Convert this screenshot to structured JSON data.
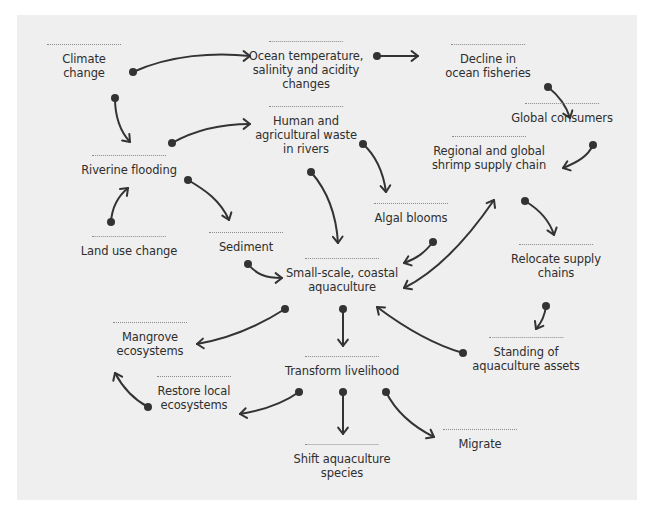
{
  "diagram": {
    "title": "",
    "colors": {
      "background": "#efefef",
      "page": "#ffffff",
      "text": "#2e2e2e",
      "arrow": "#333333",
      "rule": "#8a8a8a"
    },
    "nodes": [
      {
        "id": "climate",
        "label_lines": [
          "Climate",
          "change"
        ],
        "x": 84,
        "y": 44,
        "rule_w": 74
      },
      {
        "id": "ocean",
        "label_lines": [
          "Ocean temperature,",
          "salinity and acidity",
          "changes"
        ],
        "x": 306,
        "y": 41,
        "rule_w": 74
      },
      {
        "id": "fisheries",
        "label_lines": [
          "Decline in",
          "ocean fisheries"
        ],
        "x": 488,
        "y": 44,
        "rule_w": 74
      },
      {
        "id": "global_consumers",
        "label_lines": [
          "Global consumers"
        ],
        "x": 562,
        "y": 103,
        "rule_w": 74
      },
      {
        "id": "human_waste",
        "label_lines": [
          "Human and",
          "agricultural waste",
          "in rivers"
        ],
        "x": 306,
        "y": 106,
        "rule_w": 74
      },
      {
        "id": "supply_chain",
        "label_lines": [
          "Regional and global",
          "shrimp supply chain"
        ],
        "x": 489,
        "y": 136,
        "rule_w": 74
      },
      {
        "id": "riverine",
        "label_lines": [
          "Riverine flooding"
        ],
        "x": 129,
        "y": 155,
        "rule_w": 74
      },
      {
        "id": "algal",
        "label_lines": [
          "Algal blooms"
        ],
        "x": 411,
        "y": 203,
        "rule_w": 74
      },
      {
        "id": "land_use",
        "label_lines": [
          "Land use change"
        ],
        "x": 129,
        "y": 236,
        "rule_w": 74
      },
      {
        "id": "sediment",
        "label_lines": [
          "Sediment"
        ],
        "x": 246,
        "y": 232,
        "rule_w": 74
      },
      {
        "id": "relocate",
        "label_lines": [
          "Relocate supply",
          "chains"
        ],
        "x": 556,
        "y": 244,
        "rule_w": 74
      },
      {
        "id": "aquaculture",
        "label_lines": [
          "Small-scale, coastal",
          "aquaculture"
        ],
        "x": 342,
        "y": 258,
        "rule_w": 74
      },
      {
        "id": "mangrove",
        "label_lines": [
          "Mangrove",
          "ecosystems"
        ],
        "x": 150,
        "y": 322,
        "rule_w": 74
      },
      {
        "id": "standing",
        "label_lines": [
          "Standing of",
          "aquaculture assets"
        ],
        "x": 526,
        "y": 337,
        "rule_w": 74
      },
      {
        "id": "transform",
        "label_lines": [
          "Transform livelihood"
        ],
        "x": 342,
        "y": 356,
        "rule_w": 74
      },
      {
        "id": "restore",
        "label_lines": [
          "Restore local",
          "ecosystems"
        ],
        "x": 194,
        "y": 376,
        "rule_w": 74
      },
      {
        "id": "migrate",
        "label_lines": [
          "Migrate"
        ],
        "x": 480,
        "y": 429,
        "rule_w": 74
      },
      {
        "id": "shift",
        "label_lines": [
          "Shift aquaculture",
          "species"
        ],
        "x": 342,
        "y": 444,
        "rule_w": 74
      }
    ],
    "edges": [
      {
        "from": "climate",
        "to": "ocean",
        "path": "M133,72 C170,55 215,52 250,56",
        "start_dot": [
          133,
          72
        ],
        "end_head": [
          250,
          56
        ],
        "head_angle": 0
      },
      {
        "from": "climate",
        "to": "riverine",
        "path": "M115,98 C115,115 119,130 130,142",
        "start_dot": [
          115,
          98
        ],
        "end_head": [
          130,
          142
        ],
        "head_angle": 48
      },
      {
        "from": "ocean",
        "to": "fisheries",
        "path": "M377,56 L418,56",
        "start_dot": [
          377,
          56
        ],
        "end_head": [
          418,
          56
        ],
        "head_angle": 0
      },
      {
        "from": "fisheries",
        "to": "global_consumers",
        "path": "M548,87 C558,95 566,105 570,118",
        "start_dot": [
          548,
          87
        ],
        "end_head": [
          570,
          118
        ],
        "head_angle": 70
      },
      {
        "from": "riverine",
        "to": "human_waste",
        "path": "M172,143 C195,130 220,124 250,124",
        "start_dot": [
          172,
          143
        ],
        "end_head": [
          250,
          124
        ],
        "head_angle": 0
      },
      {
        "from": "human_waste",
        "to": "algal",
        "path": "M363,144 C375,155 383,170 386,192",
        "start_dot": [
          363,
          144
        ],
        "end_head": [
          386,
          192
        ],
        "head_angle": 85
      },
      {
        "from": "global_consumers",
        "to": "supply_chain",
        "path": "M593,145 C588,156 578,162 563,168",
        "start_dot": [
          593,
          145
        ],
        "end_head": [
          563,
          168
        ],
        "head_angle": 160
      },
      {
        "from": "human_waste",
        "to": "aquaculture",
        "path": "M311,172 C325,188 336,210 338,243",
        "start_dot": [
          311,
          172
        ],
        "end_head": [
          338,
          243
        ],
        "head_angle": 88
      },
      {
        "from": "supply_chain",
        "to": "aquaculture",
        "path": "M494,200 C470,235 440,270 404,288",
        "start_dot": null,
        "end_head": [
          404,
          288
        ],
        "head_angle": 152,
        "start_head": [
          494,
          200
        ],
        "start_head_angle": -60
      },
      {
        "from": "supply_chain",
        "to": "relocate",
        "path": "M525,201 C540,210 550,222 554,235",
        "start_dot": [
          525,
          201
        ],
        "end_head": [
          554,
          235
        ],
        "head_angle": 72
      },
      {
        "from": "algal",
        "to": "aquaculture",
        "path": "M433,242 C425,252 418,258 404,263",
        "start_dot": [
          433,
          242
        ],
        "end_head": [
          404,
          263
        ],
        "head_angle": 160
      },
      {
        "from": "land_use",
        "to": "riverine",
        "path": "M111,222 C112,207 117,197 128,188",
        "start_dot": [
          111,
          222
        ],
        "end_head": [
          128,
          188
        ],
        "head_angle": -45
      },
      {
        "from": "riverine",
        "to": "sediment",
        "path": "M188,180 C205,190 220,200 229,220",
        "start_dot": [
          188,
          180
        ],
        "end_head": [
          229,
          220
        ],
        "head_angle": 70
      },
      {
        "from": "sediment",
        "to": "aquaculture",
        "path": "M248,264 C256,274 265,278 282,278",
        "start_dot": [
          248,
          264
        ],
        "end_head": [
          282,
          278
        ],
        "head_angle": 0
      },
      {
        "from": "relocate",
        "to": "standing",
        "path": "M546,306 C545,315 542,322 536,329",
        "start_dot": [
          546,
          306
        ],
        "end_head": [
          536,
          329
        ],
        "head_angle": 120
      },
      {
        "from": "aquaculture",
        "to": "mangrove",
        "path": "M285,309 C260,325 232,338 197,344",
        "start_dot": [
          285,
          309
        ],
        "end_head": [
          197,
          344
        ],
        "head_angle": 175
      },
      {
        "from": "aquaculture",
        "to": "transform",
        "path": "M343,309 L343,346",
        "start_dot": [
          343,
          309
        ],
        "end_head": [
          343,
          346
        ],
        "head_angle": 90
      },
      {
        "from": "standing",
        "to": "aquaculture",
        "path": "M463,353 C435,345 405,328 377,307",
        "start_dot": [
          463,
          353
        ],
        "end_head": [
          377,
          307
        ],
        "head_angle": -140
      },
      {
        "from": "restore",
        "to": "mangrove",
        "path": "M148,407 C135,400 124,390 115,373",
        "start_dot": [
          148,
          407
        ],
        "end_head": [
          115,
          373
        ],
        "head_angle": -115
      },
      {
        "from": "transform",
        "to": "restore",
        "path": "M299,392 C285,402 265,410 240,414",
        "start_dot": [
          299,
          392
        ],
        "end_head": [
          240,
          414
        ],
        "head_angle": 172
      },
      {
        "from": "transform",
        "to": "shift",
        "path": "M343,392 L343,434",
        "start_dot": [
          343,
          392
        ],
        "end_head": [
          343,
          434
        ],
        "head_angle": 90
      },
      {
        "from": "transform",
        "to": "migrate",
        "path": "M386,392 C395,410 410,425 434,437",
        "start_dot": [
          386,
          392
        ],
        "end_head": [
          434,
          437
        ],
        "head_angle": 28
      }
    ]
  }
}
